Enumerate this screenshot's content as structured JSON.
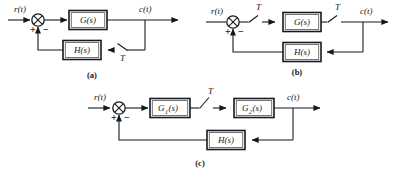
{
  "figure": {
    "ink_color": "#16181c",
    "background_color": "#ffffff"
  },
  "diagrams": [
    {
      "id": "a",
      "caption": "(a)",
      "input_label": "r(t)",
      "output_label": "c(t)",
      "sum_plus": "+",
      "sum_minus": "−",
      "forward_block": "G(s)",
      "feedback_block": "H(s)",
      "switch_label": "T",
      "switch_count": 1,
      "switch_position": "feedback-path-after-takeoff"
    },
    {
      "id": "b",
      "caption": "(b)",
      "input_label": "r(t)",
      "output_label": "c(t)",
      "sum_plus": "+",
      "sum_minus": "−",
      "forward_block": "G(s)",
      "feedback_block": "H(s)",
      "switch_label_1": "T",
      "switch_label_2": "T",
      "switch_count": 2,
      "switch_position": "before-and-after-forward-block"
    },
    {
      "id": "c",
      "caption": "(c)",
      "input_label": "r(t)",
      "output_label": "c(t)",
      "sum_plus": "+",
      "sum_minus": "−",
      "forward_block_1": "G",
      "forward_block_1_sub": "1",
      "forward_block_1_suffix": "(s)",
      "forward_block_2": "G",
      "forward_block_2_sub": "2",
      "forward_block_2_suffix": "(s)",
      "feedback_block": "H(s)",
      "switch_label": "T",
      "switch_count": 1,
      "switch_position": "between-G1-and-G2"
    }
  ]
}
